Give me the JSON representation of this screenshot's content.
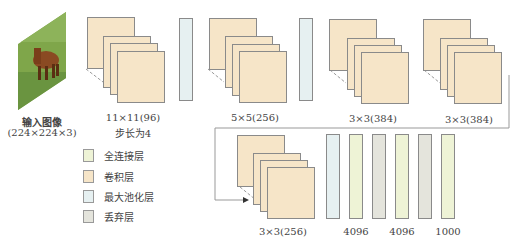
{
  "colors": {
    "conv": "#f6e5c8",
    "pool": "#e6f0f1",
    "fc": "#eef3d6",
    "dropout": "#e4e4dc",
    "border": "#8a8a8a"
  },
  "input": {
    "label": "输入图像",
    "size": "(224×224×3)",
    "icon": "horse-photo"
  },
  "layers": [
    {
      "type": "conv",
      "label": "11×11(96)",
      "sublabel": "步长为4"
    },
    {
      "type": "pool"
    },
    {
      "type": "conv",
      "label": "5×5(256)"
    },
    {
      "type": "pool"
    },
    {
      "type": "conv",
      "label": "3×3(384)"
    },
    {
      "type": "conv",
      "label": "3×3(384)"
    },
    {
      "type": "conv",
      "label": "3×3(256)"
    },
    {
      "type": "pool"
    },
    {
      "type": "fc",
      "label": "4096"
    },
    {
      "type": "dropout"
    },
    {
      "type": "fc",
      "label": "4096"
    },
    {
      "type": "dropout"
    },
    {
      "type": "fc",
      "label": "1000"
    }
  ],
  "legend": [
    {
      "key": "fc",
      "label": "全连接层"
    },
    {
      "key": "conv",
      "label": "卷积层"
    },
    {
      "key": "pool",
      "label": "最大池化层"
    },
    {
      "key": "dropout",
      "label": "丢弃层"
    }
  ]
}
